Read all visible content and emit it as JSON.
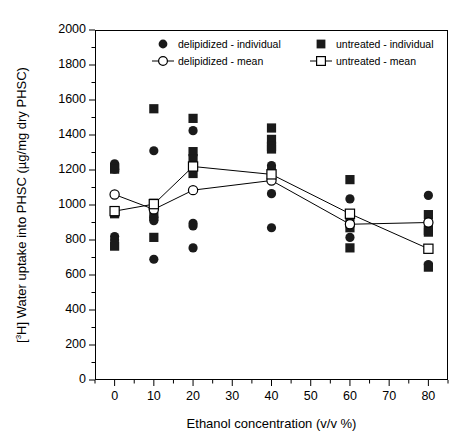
{
  "chart_data": {
    "type": "scatter",
    "title": "",
    "xlabel": "Ethanol concentration (v/v %)",
    "ylabel": "[3H] Water uptake into PHSC (µg/mg dry PHSC)",
    "xlim": [
      -5,
      85
    ],
    "ylim": [
      0,
      2000
    ],
    "xticks": [
      0,
      10,
      20,
      30,
      40,
      50,
      60,
      70,
      80
    ],
    "xticklabels": [
      "0",
      "10",
      "20",
      "30",
      "40",
      "50",
      "60",
      "70",
      "80"
    ],
    "yticks": [
      0,
      200,
      400,
      600,
      800,
      1000,
      1200,
      1400,
      1600,
      1800,
      2000
    ],
    "yticklabels": [
      "0",
      "200",
      "400",
      "600",
      "800",
      "1000",
      "1200",
      "1400",
      "1600",
      "1800",
      "2000"
    ],
    "minor_ticks": true,
    "grid": false,
    "legend_position": "top-inside",
    "marker_color": "#000000",
    "line_color": "#000000",
    "series": [
      {
        "name": "delipidized - individual",
        "marker": "filled-circle",
        "x": [
          0,
          0,
          0,
          0,
          10,
          10,
          10,
          10,
          20,
          20,
          20,
          20,
          40,
          40,
          40,
          40,
          60,
          60,
          60,
          60,
          80,
          80,
          80,
          80
        ],
        "values": [
          1235,
          1205,
          820,
          800,
          1310,
          930,
          910,
          690,
          1425,
          895,
          880,
          755,
          1225,
          1205,
          1065,
          870,
          1035,
          900,
          880,
          815,
          1055,
          905,
          880,
          660
        ]
      },
      {
        "name": "untreated - individual",
        "marker": "filled-square",
        "x": [
          0,
          0,
          0,
          0,
          10,
          10,
          10,
          10,
          20,
          20,
          20,
          20,
          40,
          40,
          40,
          40,
          60,
          60,
          60,
          60,
          80,
          80,
          80,
          80
        ],
        "values": [
          1215,
          1205,
          950,
          765,
          1550,
          1010,
          935,
          815,
          1495,
          1305,
          1265,
          1180,
          1440,
          1375,
          1335,
          1320,
          1145,
          935,
          870,
          755,
          945,
          855,
          845,
          645
        ]
      },
      {
        "name": "delipidized - mean",
        "marker": "open-circle",
        "line": true,
        "x": [
          0,
          10,
          20,
          40,
          60,
          80
        ],
        "values": [
          1060,
          975,
          1085,
          1140,
          890,
          900
        ]
      },
      {
        "name": "untreated - mean",
        "marker": "open-square",
        "line": true,
        "x": [
          0,
          10,
          20,
          40,
          60,
          80
        ],
        "values": [
          965,
          1005,
          1220,
          1175,
          950,
          750
        ]
      }
    ]
  },
  "axes": {
    "x_title": "Ethanol concentration (v/v %)",
    "y_title_prefix": "[",
    "y_title_sup": "3",
    "y_title_rest": "H] Water uptake into PHSC (µg/mg dry PHSC)"
  },
  "legend": {
    "items": [
      {
        "label": "delipidized - individual",
        "symbol": "filled-circle"
      },
      {
        "label": "untreated - individual",
        "symbol": "filled-square"
      },
      {
        "label": "delipidized - mean",
        "symbol": "open-circle-line"
      },
      {
        "label": "untreated - mean",
        "symbol": "open-square-line"
      }
    ]
  }
}
